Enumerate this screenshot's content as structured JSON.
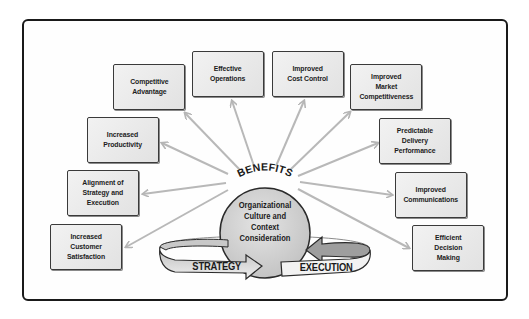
{
  "diagram": {
    "hub": {
      "title": "BENEFITS",
      "center_text": "Organizational\nCulture and\nContext\nConsideration",
      "left_band": "STRATEGY",
      "right_band": "EXECUTION"
    },
    "benefits": [
      {
        "id": "competitive-advantage",
        "label": "Competitive\nAdvantage"
      },
      {
        "id": "effective-operations",
        "label": "Effective\nOperations"
      },
      {
        "id": "improved-cost-control",
        "label": "Improved\nCost Control"
      },
      {
        "id": "improved-market-competitiveness",
        "label": "Improved\nMarket\nCompetitiveness"
      },
      {
        "id": "increased-productivity",
        "label": "Increased\nProductivity"
      },
      {
        "id": "predictable-delivery-performance",
        "label": "Predictable\nDelivery\nPerformance"
      },
      {
        "id": "alignment-of-strategy-and-execution",
        "label": "Alignment of\nStrategy and\nExecution"
      },
      {
        "id": "improved-communications",
        "label": "Improved\nCommunications"
      },
      {
        "id": "increased-customer-satisfaction",
        "label": "Increased\nCustomer\nSatisfaction"
      },
      {
        "id": "efficient-decision-making",
        "label": "Efficient\nDecision\nMaking"
      }
    ],
    "colors": {
      "box_fill": "#e8e8e8",
      "box_border": "#3a3a3a",
      "arrow": "#b8b8b8",
      "circle_fill": "#d4d4d4",
      "band_fill": "#e6e6e6",
      "band_dark": "#9a9a9a",
      "frame": "#1a1a1a"
    }
  }
}
